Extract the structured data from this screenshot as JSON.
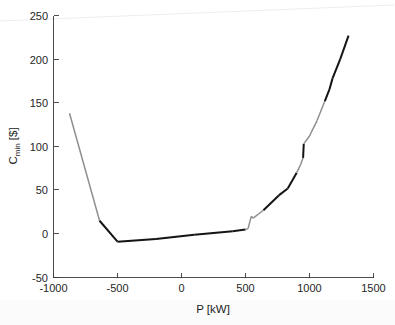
{
  "chart_data": {
    "type": "line",
    "title": "",
    "xlabel": "P [kW]",
    "ylabel": "C_min [$]",
    "ylabel_base": "C",
    "ylabel_sub": "min",
    "ylabel_unit": " [$]",
    "xlim": [
      -1000,
      1500
    ],
    "ylim": [
      -50,
      250
    ],
    "xticks": [
      -1000,
      -500,
      0,
      500,
      1000,
      1500
    ],
    "xticklabels": [
      "-1000",
      "-500",
      "0",
      "500",
      "1000",
      "1500"
    ],
    "yticks": [
      -50,
      0,
      50,
      100,
      150,
      200,
      250
    ],
    "yticklabels": [
      "-50",
      "0",
      "50",
      "100",
      "150",
      "200",
      "250"
    ],
    "grid": false,
    "legend": "none",
    "colors": {
      "dark_segment": "#141414",
      "light_segment": "#8f8f8f",
      "axis": "#3a3a3a",
      "background": "#ffffff"
    },
    "series": [
      {
        "name": "C_min(P)",
        "points": [
          [
            -875,
            138
          ],
          [
            -640,
            15
          ],
          [
            -500,
            -9
          ],
          [
            -200,
            -6
          ],
          [
            100,
            -1
          ],
          [
            400,
            3
          ],
          [
            500,
            5
          ],
          [
            520,
            6
          ],
          [
            545,
            20
          ],
          [
            560,
            18
          ],
          [
            640,
            27
          ],
          [
            760,
            44
          ],
          [
            830,
            52
          ],
          [
            900,
            70
          ],
          [
            930,
            79
          ],
          [
            950,
            87
          ],
          [
            955,
            103
          ],
          [
            1000,
            112
          ],
          [
            1060,
            130
          ],
          [
            1120,
            152
          ],
          [
            1155,
            165
          ],
          [
            1180,
            178
          ],
          [
            1240,
            200
          ],
          [
            1305,
            227
          ]
        ],
        "segment_shades": [
          "light",
          "dark",
          "dark",
          "dark",
          "dark",
          "dark",
          "light",
          "light",
          "light",
          "light",
          "dark",
          "dark",
          "dark",
          "light",
          "light",
          "dark",
          "light",
          "light",
          "light",
          "dark",
          "dark",
          "dark",
          "dark"
        ]
      }
    ],
    "annotations": []
  },
  "figure": {
    "name": "cmin-vs-power-line-chart"
  }
}
